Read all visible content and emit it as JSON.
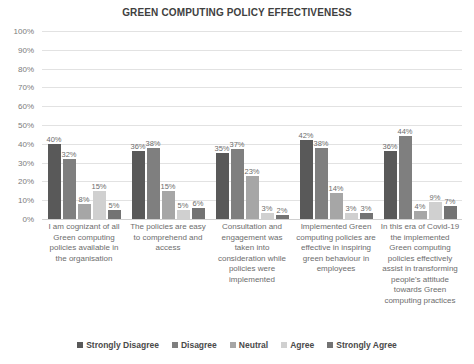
{
  "chart_data": {
    "type": "bar",
    "title": "GREEN COMPUTING POLICY EFFECTIVENESS",
    "xlabel": "",
    "ylabel": "",
    "ylim": [
      0,
      100
    ],
    "y_ticks": [
      "0%",
      "10%",
      "20%",
      "30%",
      "40%",
      "50%",
      "60%",
      "70%",
      "80%",
      "90%",
      "100%"
    ],
    "grid": true,
    "legend_position": "bottom",
    "categories": [
      "I am cognizant of all Green computing policies available in the organisation",
      "The policies are easy to comprehend and access",
      "Consultation and engagement was taken into consideration while policies were implemented",
      "Implemented Green computing policies are effective in inspiring green behaviour in employees",
      "In this era of Covid-19 the implemented Green computing policies effectively assist in transforming people's attitude towards Green computing practices"
    ],
    "series": [
      {
        "name": "Strongly Disagree",
        "color": "#595959",
        "values": [
          40,
          36,
          35,
          42,
          36
        ],
        "labels": [
          "40%",
          "36%",
          "35%",
          "42%",
          "36%"
        ]
      },
      {
        "name": "Disagree",
        "color": "#7f7f7f",
        "values": [
          32,
          38,
          37,
          38,
          44
        ],
        "labels": [
          "32%",
          "38%",
          "37%",
          "38%",
          "44%"
        ]
      },
      {
        "name": "Neutral",
        "color": "#a6a6a6",
        "values": [
          8,
          15,
          23,
          14,
          4
        ],
        "labels": [
          "8%",
          "15%",
          "23%",
          "14%",
          "4%"
        ]
      },
      {
        "name": "Agree",
        "color": "#d0d0d0",
        "values": [
          15,
          5,
          3,
          3,
          9
        ],
        "labels": [
          "15%",
          "5%",
          "3%",
          "3%",
          "9%"
        ]
      },
      {
        "name": "Strongly Agree",
        "color": "#737373",
        "values": [
          5,
          6,
          2,
          3,
          7
        ],
        "labels": [
          "5%",
          "6%",
          "2%",
          "3%",
          "7%"
        ]
      }
    ]
  }
}
